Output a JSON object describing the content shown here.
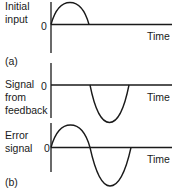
{
  "diagram": {
    "type": "signal-waveforms",
    "panels": [
      {
        "id": "a",
        "marker": "(a)",
        "ylabel_lines": [
          "Initial",
          "input"
        ],
        "zero_label": "0",
        "xlabel": "Time",
        "waveform": "positive half-sine pulse, then zero"
      },
      {
        "id": "b-feedback",
        "ylabel_lines": [
          "Signal",
          "from",
          "feedback"
        ],
        "zero_label": "0",
        "xlabel": "Time",
        "waveform": "zero, then negative half-sine pulse delayed by one half-period"
      },
      {
        "id": "b-error",
        "marker": "(b)",
        "ylabel_lines": [
          "Error",
          "signal"
        ],
        "zero_label": "0",
        "xlabel": "Time",
        "waveform": "positive half-sine followed by negative half-sine (one full sine cycle)"
      }
    ],
    "stroke_color": "#1a1a1a",
    "background": "#ffffff"
  }
}
